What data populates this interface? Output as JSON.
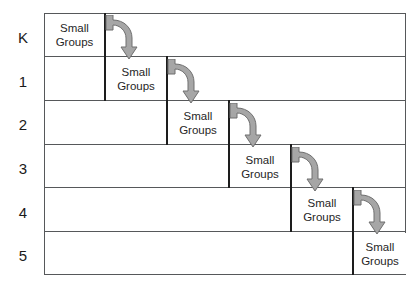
{
  "diagram": {
    "cell_label_line1": "Small",
    "cell_label_line2": "Groups",
    "arrow_color": "#9e9e9e",
    "arrow_outline_color": "#6e6e6e",
    "line_color": "#56585a",
    "cell_edge_color": "#1d1d1d",
    "text_color": "#262626",
    "background": "#ffffff",
    "rows": [
      {
        "label": "K",
        "cell_line1": "Small",
        "cell_line2": "Groups",
        "has_arrow": true
      },
      {
        "label": "1",
        "cell_line1": "Small",
        "cell_line2": "Groups",
        "has_arrow": true
      },
      {
        "label": "2",
        "cell_line1": "Small",
        "cell_line2": "Groups",
        "has_arrow": true
      },
      {
        "label": "3",
        "cell_line1": "Small",
        "cell_line2": "Groups",
        "has_arrow": true
      },
      {
        "label": "4",
        "cell_line1": "Small",
        "cell_line2": "Groups",
        "has_arrow": true
      },
      {
        "label": "5",
        "cell_line1": "Small",
        "cell_line2": "Groups",
        "has_arrow": false
      }
    ]
  }
}
